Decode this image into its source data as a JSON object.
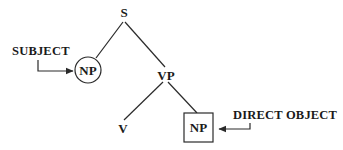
{
  "diagram": {
    "type": "syntax-tree",
    "nodes": {
      "s": {
        "label": "S",
        "x": 124,
        "y": 16
      },
      "np_subject": {
        "label": "NP",
        "x": 88,
        "y": 70,
        "shape": "circle"
      },
      "vp": {
        "label": "VP",
        "x": 166,
        "y": 78
      },
      "v": {
        "label": "V",
        "x": 122,
        "y": 132
      },
      "np_object": {
        "label": "NP",
        "x": 198,
        "y": 128,
        "shape": "box"
      }
    },
    "edges": [
      {
        "from": "S",
        "to": "NP (subject)"
      },
      {
        "from": "S",
        "to": "VP"
      },
      {
        "from": "VP",
        "to": "V"
      },
      {
        "from": "VP",
        "to": "NP (object)"
      }
    ],
    "annotations": {
      "subject": {
        "label": "SUBJECT",
        "points_to": "NP (subject)"
      },
      "direct_object": {
        "label": "DIRECT OBJECT",
        "points_to": "NP (object)"
      }
    }
  }
}
